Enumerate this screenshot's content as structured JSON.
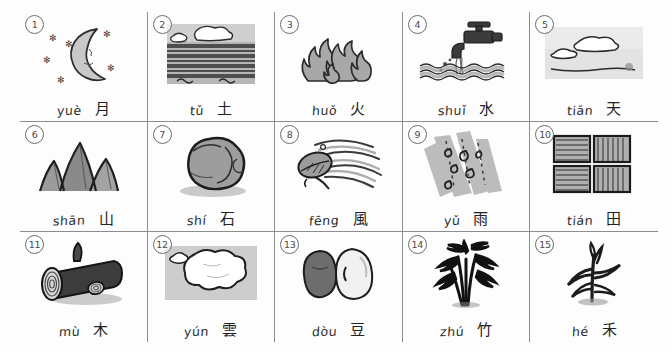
{
  "page": {
    "columns": 5,
    "rows": 3,
    "style": "hand-drawn ink and wash flashcards",
    "background_color": "#fdfdfd",
    "border_color": "#8d8d8d",
    "ink_color": "#2a2a2a"
  },
  "cells": [
    {
      "number": "1",
      "pinyin": "yuè",
      "hanzi": "月",
      "meaning": "moon",
      "icon": "crescent-moon-with-stars-icon"
    },
    {
      "number": "2",
      "pinyin": "tǔ",
      "hanzi": "土",
      "meaning": "soil / earth",
      "icon": "plowed-field-soil-icon"
    },
    {
      "number": "3",
      "pinyin": "huǒ",
      "hanzi": "火",
      "meaning": "fire",
      "icon": "flames-icon"
    },
    {
      "number": "4",
      "pinyin": "shuǐ",
      "hanzi": "水",
      "meaning": "water",
      "icon": "faucet-pouring-water-icon"
    },
    {
      "number": "5",
      "pinyin": "tiān",
      "hanzi": "天",
      "meaning": "sky / heaven",
      "icon": "sky-with-clouds-icon"
    },
    {
      "number": "6",
      "pinyin": "shān",
      "hanzi": "山",
      "meaning": "mountain",
      "icon": "mountain-peaks-icon"
    },
    {
      "number": "7",
      "pinyin": "shí",
      "hanzi": "石",
      "meaning": "stone / rock",
      "icon": "rock-boulder-icon"
    },
    {
      "number": "8",
      "pinyin": "fēng",
      "hanzi": "風",
      "meaning": "wind",
      "icon": "leaf-blowing-in-wind-icon"
    },
    {
      "number": "9",
      "pinyin": "yǔ",
      "hanzi": "雨",
      "meaning": "rain",
      "icon": "falling-raindrops-icon"
    },
    {
      "number": "10",
      "pinyin": "tián",
      "hanzi": "田",
      "meaning": "rice field",
      "icon": "four-field-plots-icon"
    },
    {
      "number": "11",
      "pinyin": "mù",
      "hanzi": "木",
      "meaning": "wood / tree",
      "icon": "cut-log-icon"
    },
    {
      "number": "12",
      "pinyin": "yún",
      "hanzi": "雲",
      "meaning": "cloud",
      "icon": "fluffy-cloud-icon"
    },
    {
      "number": "13",
      "pinyin": "dòu",
      "hanzi": "豆",
      "meaning": "bean",
      "icon": "two-beans-icon"
    },
    {
      "number": "14",
      "pinyin": "zhú",
      "hanzi": "竹",
      "meaning": "bamboo",
      "icon": "bamboo-stalks-icon"
    },
    {
      "number": "15",
      "pinyin": "hé",
      "hanzi": "禾",
      "meaning": "grain / rice plant",
      "icon": "grain-plant-icon"
    }
  ]
}
